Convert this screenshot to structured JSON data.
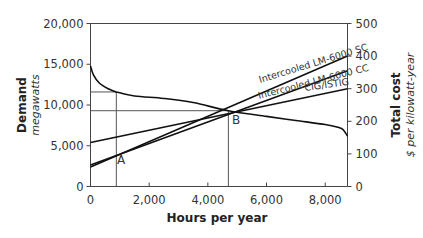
{
  "chart_data": {
    "type": "line",
    "title": "",
    "xlabel": "Hours per year",
    "ylabel_left": {
      "title": "Demand",
      "subtitle": "megawatts"
    },
    "ylabel_right": {
      "title": "Total cost",
      "subtitle": "$ per kilowatt-year"
    },
    "xlim": [
      0,
      8760
    ],
    "ylim_left": [
      0,
      20000
    ],
    "ylim_right": [
      0,
      500
    ],
    "x_ticks": [
      0,
      2000,
      4000,
      6000,
      8000
    ],
    "x_tick_labels": [
      "0",
      "2,000",
      "4,000",
      "6,000",
      "8,000"
    ],
    "y_left_ticks": [
      0,
      5000,
      10000,
      15000,
      20000
    ],
    "y_left_tick_labels": [
      "0",
      "5,000",
      "10,000",
      "15,000",
      "20,000"
    ],
    "y_right_ticks": [
      0,
      100,
      200,
      300,
      400,
      500
    ],
    "y_right_tick_labels": [
      "0",
      "100",
      "200",
      "300",
      "400",
      "500"
    ],
    "grid": false,
    "legend": "inline labels",
    "series": [
      {
        "name": "Demand (load duration curve)",
        "axis": "left",
        "x": [
          0,
          100,
          300,
          600,
          880,
          1500,
          2500,
          3500,
          4700,
          6000,
          7000,
          8000,
          8400,
          8600,
          8760
        ],
        "values": [
          14800,
          13700,
          12700,
          12000,
          11600,
          11100,
          10800,
          10300,
          9300,
          8600,
          8100,
          7600,
          7300,
          7000,
          6200
        ]
      },
      {
        "name": "Intercooled LM-6000 SC",
        "axis": "right",
        "x": [
          0,
          8760
        ],
        "values": [
          60,
          400
        ]
      },
      {
        "name": "Intercooled LM-6000 CC",
        "axis": "right",
        "x": [
          0,
          8760
        ],
        "values": [
          66,
          355
        ]
      },
      {
        "name": "CIG/ISTIG",
        "axis": "right",
        "x": [
          0,
          8760
        ],
        "values": [
          135,
          300
        ]
      }
    ],
    "annotations": [
      {
        "label": "A",
        "x": 880,
        "note": "vertical line at crossing of SC and CC with CIG/ISTIG region",
        "horizontal_y_left": 11600
      },
      {
        "label": "B",
        "x": 4700,
        "note": "vertical line at crossing of cost lines",
        "horizontal_y_left": 9300
      }
    ]
  },
  "labels": {
    "series_sc": "Intercooled LM-6000 SC",
    "series_cc": "Intercooled LM-6000 CC",
    "series_cig": "CIG/ISTIG",
    "point_a": "A",
    "point_b": "B"
  }
}
